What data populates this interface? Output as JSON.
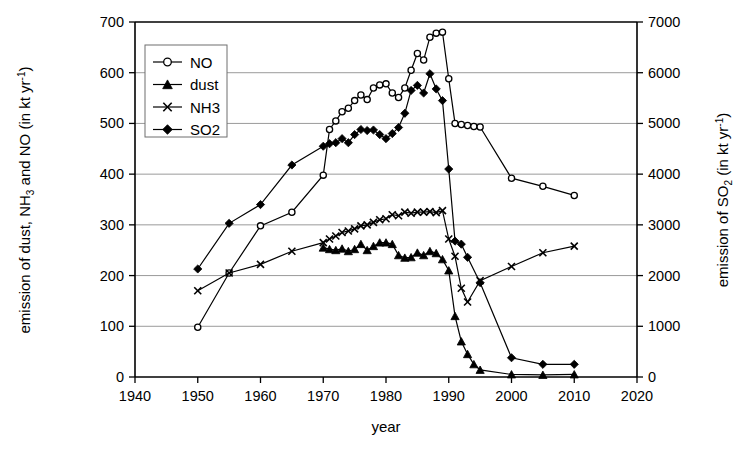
{
  "chart_data": {
    "type": "line",
    "title": "",
    "xlabel": "year",
    "ylabel": "emission of dust, NH3 and NO (in kt yr-1)",
    "ylabel_right": "emission of SO2 (in kt yr-1)",
    "xlim": [
      1940,
      2020
    ],
    "ylim": [
      0,
      700
    ],
    "ylim_right": [
      0,
      7000
    ],
    "xticks": [
      1940,
      1950,
      1960,
      1970,
      1980,
      1990,
      2000,
      2010,
      2020
    ],
    "yticks": [
      0,
      100,
      200,
      300,
      400,
      500,
      600,
      700
    ],
    "yticks_right": [
      0,
      1000,
      2000,
      3000,
      4000,
      5000,
      6000,
      7000
    ],
    "grid": true,
    "legend_position": "top-left",
    "legend_entries": [
      "NO",
      "dust",
      "NH3",
      "SO2"
    ],
    "series": [
      {
        "name": "NO",
        "marker": "open-circle",
        "axis": "left",
        "points": [
          [
            1950,
            98
          ],
          [
            1955,
            205
          ],
          [
            1960,
            298
          ],
          [
            1965,
            325
          ],
          [
            1970,
            398
          ],
          [
            1971,
            488
          ],
          [
            1972,
            505
          ],
          [
            1973,
            523
          ],
          [
            1974,
            530
          ],
          [
            1975,
            545
          ],
          [
            1976,
            556
          ],
          [
            1977,
            547
          ],
          [
            1978,
            570
          ],
          [
            1979,
            576
          ],
          [
            1980,
            578
          ],
          [
            1981,
            560
          ],
          [
            1982,
            551
          ],
          [
            1983,
            570
          ],
          [
            1984,
            605
          ],
          [
            1985,
            638
          ],
          [
            1986,
            625
          ],
          [
            1987,
            670
          ],
          [
            1988,
            678
          ],
          [
            1989,
            680
          ],
          [
            1990,
            588
          ],
          [
            1991,
            500
          ],
          [
            1992,
            498
          ],
          [
            1993,
            496
          ],
          [
            1994,
            494
          ],
          [
            1995,
            493
          ],
          [
            2000,
            392
          ],
          [
            2005,
            376
          ],
          [
            2010,
            358
          ]
        ]
      },
      {
        "name": "dust",
        "marker": "filled-triangle",
        "axis": "left",
        "points": [
          [
            1970,
            255
          ],
          [
            1971,
            252
          ],
          [
            1972,
            250
          ],
          [
            1973,
            253
          ],
          [
            1974,
            248
          ],
          [
            1975,
            252
          ],
          [
            1976,
            262
          ],
          [
            1977,
            250
          ],
          [
            1978,
            258
          ],
          [
            1979,
            265
          ],
          [
            1980,
            265
          ],
          [
            1981,
            262
          ],
          [
            1982,
            240
          ],
          [
            1983,
            235
          ],
          [
            1984,
            236
          ],
          [
            1985,
            245
          ],
          [
            1986,
            240
          ],
          [
            1987,
            248
          ],
          [
            1988,
            244
          ],
          [
            1989,
            232
          ],
          [
            1990,
            210
          ],
          [
            1991,
            120
          ],
          [
            1992,
            70
          ],
          [
            1993,
            45
          ],
          [
            1994,
            25
          ],
          [
            1995,
            14
          ],
          [
            2000,
            5
          ],
          [
            2005,
            4
          ],
          [
            2010,
            5
          ]
        ]
      },
      {
        "name": "NH3",
        "marker": "cross",
        "axis": "left",
        "points": [
          [
            1950,
            170
          ],
          [
            1955,
            205
          ],
          [
            1960,
            222
          ],
          [
            1965,
            248
          ],
          [
            1970,
            265
          ],
          [
            1971,
            272
          ],
          [
            1972,
            278
          ],
          [
            1973,
            285
          ],
          [
            1974,
            288
          ],
          [
            1975,
            292
          ],
          [
            1976,
            298
          ],
          [
            1977,
            300
          ],
          [
            1978,
            305
          ],
          [
            1979,
            310
          ],
          [
            1980,
            312
          ],
          [
            1981,
            320
          ],
          [
            1982,
            318
          ],
          [
            1983,
            325
          ],
          [
            1984,
            323
          ],
          [
            1985,
            325
          ],
          [
            1986,
            325
          ],
          [
            1987,
            326
          ],
          [
            1988,
            324
          ],
          [
            1989,
            328
          ],
          [
            1990,
            272
          ],
          [
            1991,
            238
          ],
          [
            1992,
            175
          ],
          [
            1993,
            148
          ],
          [
            1995,
            190
          ],
          [
            2000,
            218
          ],
          [
            2005,
            245
          ],
          [
            2010,
            258
          ]
        ]
      },
      {
        "name": "SO2",
        "marker": "filled-diamond",
        "axis": "left_scaled",
        "points": [
          [
            1950,
            213
          ],
          [
            1955,
            303
          ],
          [
            1960,
            340
          ],
          [
            1965,
            418
          ],
          [
            1970,
            455
          ],
          [
            1971,
            460
          ],
          [
            1972,
            462
          ],
          [
            1973,
            470
          ],
          [
            1974,
            462
          ],
          [
            1975,
            478
          ],
          [
            1976,
            488
          ],
          [
            1977,
            486
          ],
          [
            1978,
            487
          ],
          [
            1979,
            478
          ],
          [
            1980,
            470
          ],
          [
            1981,
            480
          ],
          [
            1982,
            492
          ],
          [
            1983,
            520
          ],
          [
            1984,
            565
          ],
          [
            1985,
            575
          ],
          [
            1986,
            560
          ],
          [
            1987,
            598
          ],
          [
            1988,
            568
          ],
          [
            1989,
            545
          ],
          [
            1990,
            410
          ],
          [
            1991,
            268
          ],
          [
            1992,
            262
          ],
          [
            1993,
            236
          ],
          [
            1995,
            186
          ],
          [
            2000,
            38
          ],
          [
            2005,
            25
          ],
          [
            2010,
            25
          ]
        ]
      }
    ]
  },
  "axes": {
    "left_title_parts": {
      "a": "emission of dust, NH",
      "sub": "3",
      "b": " and NO (in kt yr",
      "sup": "-1",
      "c": ")"
    },
    "right_title_parts": {
      "a": "emission of SO",
      "sub": "2",
      "b": " (in kt yr",
      "sup": "-1",
      "c": ")"
    },
    "x_title": "year"
  },
  "colors": {
    "line": "#000000",
    "grid": "#808080",
    "axis": "#000000",
    "background": "#ffffff"
  }
}
